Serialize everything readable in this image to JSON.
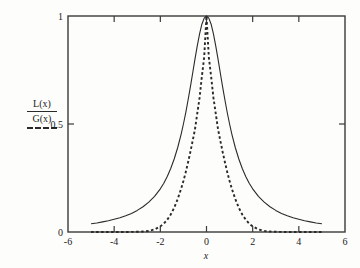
{
  "figure": {
    "background_color": "#fdfdfc",
    "axis_color": "#3a3a3a",
    "curve_color": "#2a2a2a"
  },
  "legend": {
    "numerator_label": "L(x)",
    "denominator_label": "G(x)",
    "dash_sample_name": "dashed-line-sample"
  },
  "chart_data": {
    "type": "line",
    "title": "",
    "subtitle": "",
    "xlabel": "x",
    "ylabel": "",
    "xlim": [
      -6,
      6
    ],
    "ylim": [
      0,
      1
    ],
    "xticks": [
      -6,
      -4,
      -2,
      0,
      2,
      4,
      6
    ],
    "xticklabels": [
      "-6",
      "-4",
      "-2",
      "0",
      "2",
      "4",
      "6"
    ],
    "yticks": [
      0,
      0.5,
      1
    ],
    "yticklabels": [
      "0",
      "0.5",
      "1"
    ],
    "grid": false,
    "legend_position": "outside-left",
    "frame": "box",
    "tick_direction": "in",
    "series": [
      {
        "name": "L(x)",
        "style": "solid",
        "color": "#2a2a2a",
        "description": "Lorentzian profile normalized to peak 1, HWHM = 1",
        "x": [
          -5.0,
          -4.75,
          -4.5,
          -4.25,
          -4.0,
          -3.75,
          -3.5,
          -3.25,
          -3.0,
          -2.75,
          -2.5,
          -2.25,
          -2.0,
          -1.85,
          -1.7,
          -1.55,
          -1.4,
          -1.25,
          -1.1,
          -1.0,
          -0.9,
          -0.8,
          -0.7,
          -0.6,
          -0.5,
          -0.4,
          -0.3,
          -0.2,
          -0.1,
          0.0,
          0.1,
          0.2,
          0.3,
          0.4,
          0.5,
          0.6,
          0.7,
          0.8,
          0.9,
          1.0,
          1.1,
          1.25,
          1.4,
          1.55,
          1.7,
          1.85,
          2.0,
          2.25,
          2.5,
          2.75,
          3.0,
          3.25,
          3.5,
          3.75,
          4.0,
          4.25,
          4.5,
          4.75,
          5.0
        ],
        "y": [
          0.038,
          0.042,
          0.047,
          0.052,
          0.059,
          0.066,
          0.075,
          0.086,
          0.1,
          0.117,
          0.138,
          0.165,
          0.2,
          0.226,
          0.257,
          0.294,
          0.338,
          0.39,
          0.452,
          0.5,
          0.552,
          0.61,
          0.671,
          0.735,
          0.8,
          0.862,
          0.917,
          0.962,
          0.99,
          1.0,
          0.99,
          0.962,
          0.917,
          0.862,
          0.8,
          0.735,
          0.671,
          0.61,
          0.552,
          0.5,
          0.452,
          0.39,
          0.338,
          0.294,
          0.257,
          0.226,
          0.2,
          0.165,
          0.138,
          0.117,
          0.1,
          0.086,
          0.075,
          0.066,
          0.059,
          0.052,
          0.047,
          0.042,
          0.038
        ]
      },
      {
        "name": "G(x)",
        "style": "dashed",
        "color": "#2a2a2a",
        "description": "Gaussian profile normalized to peak 1, HWHM ~ 0.85",
        "x": [
          -5.0,
          -4.5,
          -4.0,
          -3.5,
          -3.0,
          -2.75,
          -2.5,
          -2.25,
          -2.0,
          -1.85,
          -1.7,
          -1.55,
          -1.4,
          -1.25,
          -1.1,
          -1.0,
          -0.9,
          -0.8,
          -0.7,
          -0.6,
          -0.5,
          -0.4,
          -0.3,
          -0.2,
          -0.1,
          0.0,
          0.1,
          0.2,
          0.3,
          0.4,
          0.5,
          0.6,
          0.7,
          0.8,
          0.9,
          1.0,
          1.1,
          1.25,
          1.4,
          1.55,
          1.7,
          1.85,
          2.0,
          2.25,
          2.5,
          2.75,
          3.0,
          3.5,
          4.0,
          4.5,
          5.0
        ],
        "y": [
          0.0,
          0.0,
          0.0,
          0.0,
          0.001,
          0.002,
          0.005,
          0.012,
          0.026,
          0.039,
          0.057,
          0.081,
          0.112,
          0.152,
          0.2,
          0.236,
          0.277,
          0.322,
          0.37,
          0.422,
          0.475,
          0.549,
          0.622,
          0.72,
          0.81,
          1.0,
          0.81,
          0.72,
          0.622,
          0.549,
          0.475,
          0.422,
          0.37,
          0.322,
          0.277,
          0.236,
          0.2,
          0.152,
          0.112,
          0.081,
          0.057,
          0.039,
          0.026,
          0.012,
          0.005,
          0.002,
          0.001,
          0.0,
          0.0,
          0.0,
          0.0
        ]
      }
    ]
  }
}
